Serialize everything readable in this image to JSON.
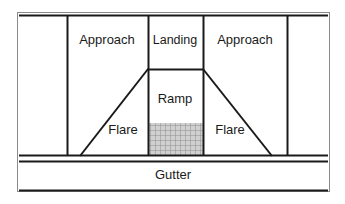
{
  "figure": {
    "type": "technical-diagram",
    "background_color": "#ffffff",
    "line_color": "#1a1a1a",
    "hatch_color": "#9a9a9a",
    "hatch_fill": "#cfcfcf"
  },
  "frame": {
    "x": 17,
    "y": 12,
    "width": 313,
    "height": 180,
    "border_color": "#8a8a8a"
  },
  "labels": [
    {
      "name": "approach-left",
      "text": "Approach",
      "x": 107,
      "y": 41
    },
    {
      "name": "landing",
      "text": "Landing",
      "x": 175,
      "y": 41
    },
    {
      "name": "approach-right",
      "text": "Approach",
      "x": 245,
      "y": 41
    },
    {
      "name": "ramp",
      "text": "Ramp",
      "x": 175,
      "y": 100
    },
    {
      "name": "flare-left",
      "text": "Flare",
      "x": 123,
      "y": 131
    },
    {
      "name": "flare-right",
      "text": "Flare",
      "x": 230,
      "y": 131
    },
    {
      "name": "gutter",
      "text": "Gutter",
      "x": 173,
      "y": 176
    }
  ],
  "geometry": {
    "vertical_lines": [
      {
        "name": "sidewalk-edge-left",
        "x": 67,
        "y1": 15,
        "y2": 155
      },
      {
        "name": "landing-edge-left",
        "x": 148,
        "y1": 15,
        "y2": 155
      },
      {
        "name": "landing-edge-right",
        "x": 203,
        "y1": 15,
        "y2": 155
      },
      {
        "name": "sidewalk-edge-right",
        "x": 287,
        "y1": 15,
        "y2": 155
      }
    ],
    "horizontal_lines": [
      {
        "name": "ramp-top-edge",
        "y": 69,
        "x1": 148,
        "x2": 203
      },
      {
        "name": "curb-line-upper",
        "y": 155,
        "x1": 19,
        "x2": 328
      },
      {
        "name": "curb-line-lower",
        "y": 161,
        "x1": 19,
        "x2": 328
      }
    ],
    "diagonals": [
      {
        "name": "flare-left-edge",
        "x1": 80,
        "y1": 155,
        "x2": 148,
        "y2": 69
      },
      {
        "name": "flare-right-edge",
        "x1": 203,
        "y1": 69,
        "x2": 272,
        "y2": 155
      }
    ],
    "hatch_region": {
      "name": "ramp-hatch",
      "x": 148,
      "y": 123,
      "width": 55,
      "height": 32
    }
  }
}
